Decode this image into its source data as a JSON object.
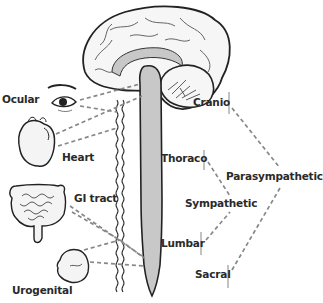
{
  "diagram": {
    "organs": [
      {
        "id": "ocular",
        "label": "Ocular"
      },
      {
        "id": "heart",
        "label": "Heart"
      },
      {
        "id": "gi",
        "label": "GI tract"
      },
      {
        "id": "urogenital",
        "label": "Urogenital"
      }
    ],
    "spinal_regions": [
      {
        "id": "cranio",
        "label": "Cranio"
      },
      {
        "id": "thoraco",
        "label": "Thoraco"
      },
      {
        "id": "lumbar",
        "label": "Lumbar"
      },
      {
        "id": "sacral",
        "label": "Sacral"
      }
    ],
    "divisions": [
      {
        "id": "sympathetic",
        "label": "Sympathetic",
        "connects": [
          "Thoraco",
          "Lumbar"
        ]
      },
      {
        "id": "parasympathetic",
        "label": "Parasympathetic",
        "connects": [
          "Cranio",
          "Sacral"
        ]
      }
    ],
    "colors": {
      "outline": "#222222",
      "spinal_cord_fill": "#c8c8c8",
      "dashed_line": "#888888",
      "organ_fill": "#f4f4f4"
    }
  }
}
